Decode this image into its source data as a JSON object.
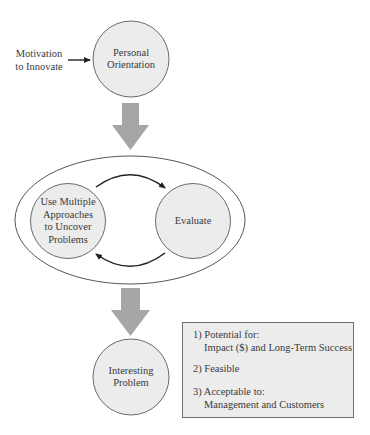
{
  "diagram": {
    "input_label": {
      "line1": "Motivation",
      "line2": "to Innovate"
    },
    "nodes": {
      "personal_orientation": {
        "line1": "Personal",
        "line2": "Orientation"
      },
      "use_multiple_approaches": {
        "line1": "Use Multiple",
        "line2": "Approaches",
        "line3": "to Uncover",
        "line4": "Problems"
      },
      "evaluate": {
        "line1": "Evaluate"
      },
      "interesting_problem": {
        "line1": "Interesting",
        "line2": "Problem"
      }
    },
    "criteria_box": {
      "item1_title": "1) Potential for:",
      "item1_detail": "Impact ($) and Long-Term Success",
      "item2_title": "2) Feasible",
      "item3_title": "3) Acceptable to:",
      "item3_detail": "Management and Customers"
    },
    "colors": {
      "circle_fill": "#ececec",
      "circle_stroke": "#6a6a6a",
      "block_arrow": "#a6a6a6",
      "line_arrow": "#222222",
      "box_fill": "#ececec"
    }
  }
}
